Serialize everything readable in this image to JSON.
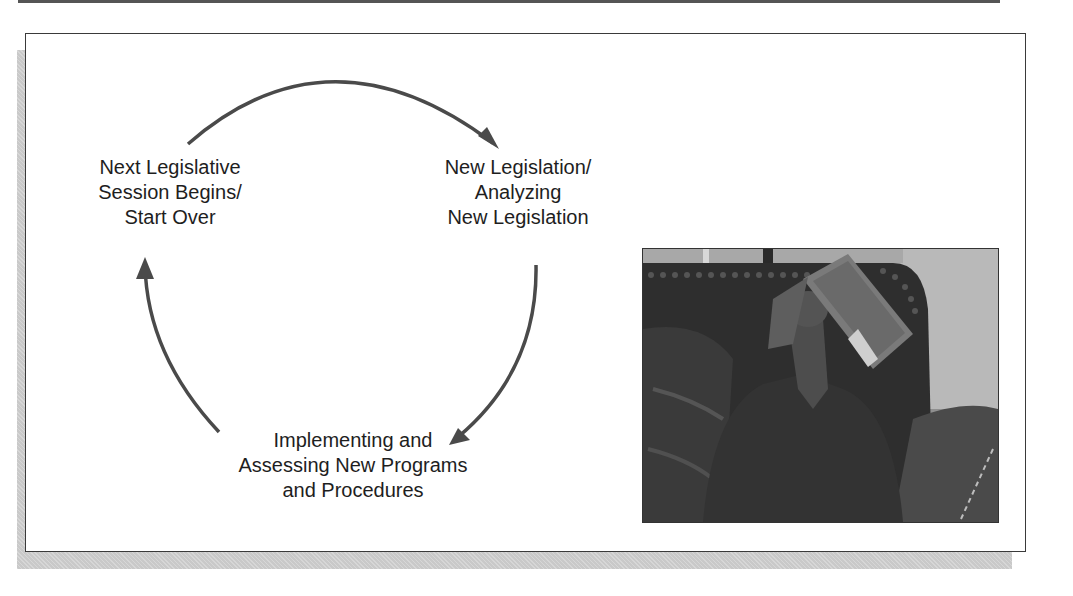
{
  "diagram": {
    "type": "cycle",
    "stages": [
      {
        "id": "next-session",
        "lines": [
          "Next Legislative",
          "Session Begins/",
          "Start Over"
        ]
      },
      {
        "id": "new-legislation",
        "lines": [
          "New Legislation/",
          "Analyzing",
          "New Legislation"
        ]
      },
      {
        "id": "implementing",
        "lines": [
          "Implementing and",
          "Assessing New Programs",
          "and Procedures"
        ]
      }
    ],
    "flow": [
      {
        "from": "next-session",
        "to": "new-legislation"
      },
      {
        "from": "new-legislation",
        "to": "implementing"
      },
      {
        "from": "implementing",
        "to": "next-session"
      }
    ],
    "arrow_color": "#4a4a4a"
  },
  "photo": {
    "alt": "Person reclining on a leather couch with an open magazine covering their face",
    "style": "grayscale"
  },
  "colors": {
    "frame_border": "#3a3a3a",
    "shadow": "#c9c9c9",
    "text": "#1e1e1e"
  }
}
